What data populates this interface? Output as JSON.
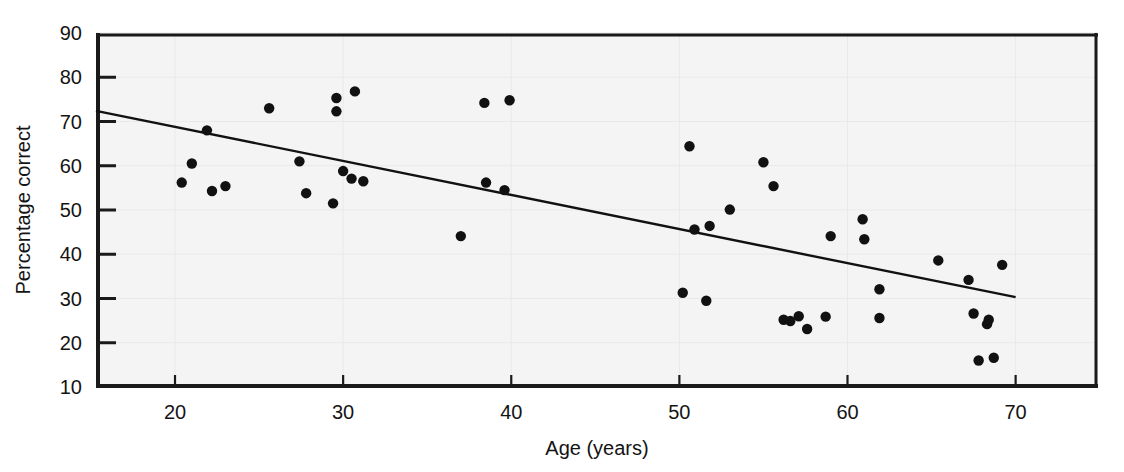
{
  "chart_data": {
    "type": "scatter",
    "title": "",
    "xlabel": "Age (years)",
    "ylabel": "Percentage correct",
    "xlim": [
      15.3,
      74.9
    ],
    "ylim": [
      10,
      90
    ],
    "xticks": [
      20,
      30,
      40,
      50,
      60,
      70
    ],
    "xtick_labels": [
      "20",
      "30",
      "40",
      "50",
      "60",
      "70"
    ],
    "yticks": [
      10,
      20,
      30,
      40,
      50,
      60,
      70,
      80,
      90
    ],
    "ytick_labels": [
      "10",
      "20",
      "30",
      "40",
      "50",
      "60",
      "70",
      "80",
      "90"
    ],
    "grid": true,
    "legend": "none",
    "marker_color": "#111111",
    "trendline_color": "#111111",
    "points": [
      {
        "x": 20.4,
        "y": 56.2
      },
      {
        "x": 21.0,
        "y": 60.5
      },
      {
        "x": 21.9,
        "y": 68.0
      },
      {
        "x": 22.2,
        "y": 54.3
      },
      {
        "x": 23.0,
        "y": 55.4
      },
      {
        "x": 25.6,
        "y": 73.0
      },
      {
        "x": 27.4,
        "y": 61.0
      },
      {
        "x": 27.8,
        "y": 53.8
      },
      {
        "x": 29.4,
        "y": 51.5
      },
      {
        "x": 29.6,
        "y": 72.3
      },
      {
        "x": 29.6,
        "y": 75.3
      },
      {
        "x": 30.0,
        "y": 58.8
      },
      {
        "x": 30.5,
        "y": 57.1
      },
      {
        "x": 30.7,
        "y": 76.8
      },
      {
        "x": 31.2,
        "y": 56.5
      },
      {
        "x": 37.0,
        "y": 44.1
      },
      {
        "x": 38.4,
        "y": 74.2
      },
      {
        "x": 38.5,
        "y": 56.2
      },
      {
        "x": 39.6,
        "y": 54.5
      },
      {
        "x": 39.9,
        "y": 74.8
      },
      {
        "x": 50.2,
        "y": 31.3
      },
      {
        "x": 50.6,
        "y": 64.4
      },
      {
        "x": 50.9,
        "y": 45.6
      },
      {
        "x": 51.6,
        "y": 29.5
      },
      {
        "x": 51.8,
        "y": 46.4
      },
      {
        "x": 53.0,
        "y": 50.1
      },
      {
        "x": 55.0,
        "y": 60.8
      },
      {
        "x": 55.6,
        "y": 55.4
      },
      {
        "x": 56.2,
        "y": 25.2
      },
      {
        "x": 56.6,
        "y": 24.9
      },
      {
        "x": 57.1,
        "y": 26.0
      },
      {
        "x": 57.6,
        "y": 23.1
      },
      {
        "x": 59.0,
        "y": 44.1
      },
      {
        "x": 58.7,
        "y": 25.9
      },
      {
        "x": 60.9,
        "y": 47.9
      },
      {
        "x": 61.0,
        "y": 43.4
      },
      {
        "x": 61.9,
        "y": 32.1
      },
      {
        "x": 61.9,
        "y": 25.6
      },
      {
        "x": 65.4,
        "y": 38.6
      },
      {
        "x": 67.2,
        "y": 34.2
      },
      {
        "x": 67.5,
        "y": 26.6
      },
      {
        "x": 67.8,
        "y": 16.0
      },
      {
        "x": 68.4,
        "y": 25.2
      },
      {
        "x": 68.3,
        "y": 24.2
      },
      {
        "x": 68.7,
        "y": 16.6
      },
      {
        "x": 69.2,
        "y": 37.6
      }
    ],
    "trendline": {
      "x0": 15.3,
      "y0": 72.4,
      "x1": 70.0,
      "y1": 30.3
    }
  }
}
